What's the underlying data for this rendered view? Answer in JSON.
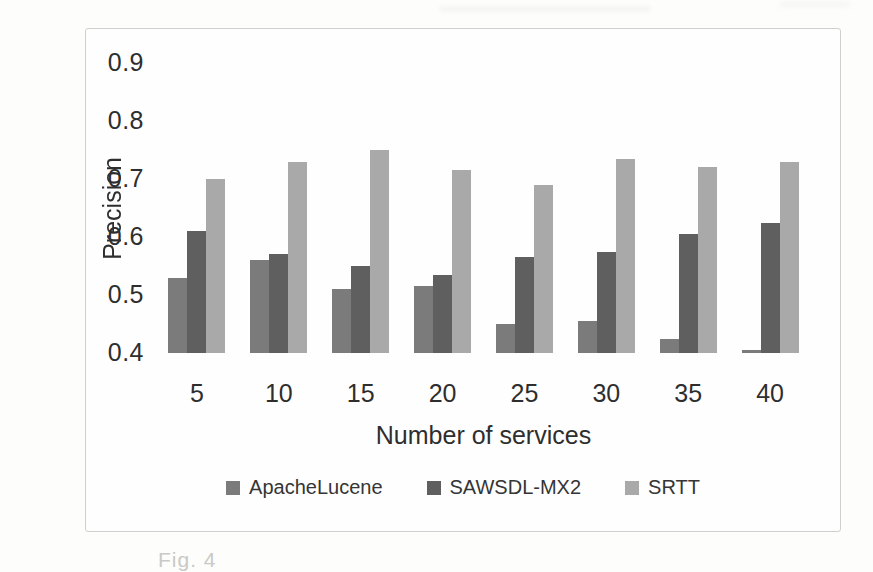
{
  "page": {
    "caption_fragment": "Fig. 4"
  },
  "chart": {
    "ylabel": "Precision",
    "xlabel": "Number of services"
  },
  "chart_data": {
    "type": "bar",
    "title": "",
    "categories": [
      "5",
      "10",
      "15",
      "20",
      "25",
      "30",
      "35",
      "40"
    ],
    "series": [
      {
        "name": "ApacheLucene",
        "color": "#7b7b7b",
        "values": [
          0.53,
          0.56,
          0.51,
          0.515,
          0.45,
          0.455,
          0.425,
          0.405
        ]
      },
      {
        "name": "SAWSDL-MX2",
        "color": "#5f5f5f",
        "values": [
          0.61,
          0.57,
          0.55,
          0.535,
          0.565,
          0.575,
          0.605,
          0.625
        ]
      },
      {
        "name": "SRTT",
        "color": "#a9a9a9",
        "values": [
          0.7,
          0.73,
          0.75,
          0.715,
          0.69,
          0.735,
          0.72,
          0.73
        ]
      }
    ],
    "xlabel": "Number of services",
    "ylabel": "Precision",
    "ylim": [
      0.4,
      0.9
    ],
    "yticks": [
      "0.9",
      "0.8",
      "0.7",
      "0.6",
      "0.5",
      "0.4"
    ],
    "grid": true,
    "legend_position": "bottom"
  },
  "colors": {
    "gridline": "#d5d5d3",
    "frame_border": "#cfcfcd",
    "text": "#2e2e2e",
    "caption": "#c9c9c7"
  }
}
